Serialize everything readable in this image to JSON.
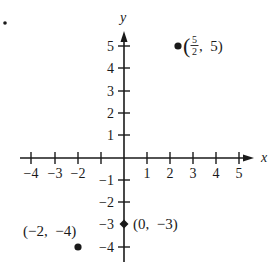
{
  "figure": {
    "bullet_marker": "•",
    "axes": {
      "x_label": "x",
      "y_label": "y",
      "x_ticks": [
        {
          "value": -4,
          "label": "−4"
        },
        {
          "value": -3,
          "label": "−3"
        },
        {
          "value": -2,
          "label": "−2"
        },
        {
          "value": -1,
          "label": ""
        },
        {
          "value": 1,
          "label": "1"
        },
        {
          "value": 2,
          "label": "2"
        },
        {
          "value": 3,
          "label": "3"
        },
        {
          "value": 4,
          "label": "4"
        },
        {
          "value": 5,
          "label": "5"
        }
      ],
      "y_ticks": [
        {
          "value": 5,
          "label": "5"
        },
        {
          "value": 4,
          "label": "4"
        },
        {
          "value": 3,
          "label": "3"
        },
        {
          "value": 2,
          "label": "2"
        },
        {
          "value": 1,
          "label": "1"
        },
        {
          "value": -1,
          "label": "−1"
        },
        {
          "value": -2,
          "label": "−2"
        },
        {
          "value": -3,
          "label": "−3"
        },
        {
          "value": -4,
          "label": "−4"
        }
      ]
    },
    "points": [
      {
        "x": 2.5,
        "y": 5,
        "label_open": "(",
        "label_num": "5",
        "label_den": "2",
        "label_rest": ",  5)"
      },
      {
        "x": -2,
        "y": -4,
        "label": "(−2,  −4)"
      },
      {
        "x": 0,
        "y": -3,
        "label": "(0,  −3)"
      }
    ],
    "colors": {
      "ink": "#1a1a1a",
      "background": "#ffffff"
    }
  }
}
